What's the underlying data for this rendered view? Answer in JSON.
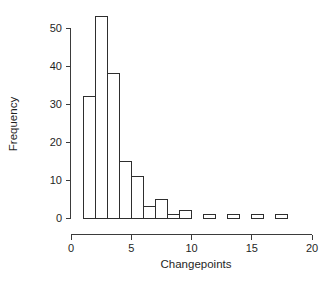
{
  "chart_data": {
    "type": "bar",
    "subtype": "histogram",
    "title": "",
    "xlabel": "Changepoints",
    "ylabel": "Frequency",
    "xlim": [
      0,
      20
    ],
    "ylim": [
      0,
      53
    ],
    "xticks": [
      0,
      5,
      10,
      15,
      20
    ],
    "xticklabels": [
      "0",
      "5",
      "10",
      "15",
      "20"
    ],
    "yticks": [
      0,
      10,
      20,
      30,
      40,
      50
    ],
    "yticklabels": [
      "0",
      "10",
      "20",
      "30",
      "40",
      "50"
    ],
    "grid": false,
    "legend": null,
    "bin_width": 1,
    "bin_edges": [
      1,
      2,
      3,
      4,
      5,
      6,
      7,
      8,
      9,
      10,
      11,
      12,
      13,
      14,
      15,
      16,
      17,
      18
    ],
    "bins": [
      {
        "x0": 1,
        "x1": 2,
        "value": 32
      },
      {
        "x0": 2,
        "x1": 3,
        "value": 53
      },
      {
        "x0": 3,
        "x1": 4,
        "value": 38
      },
      {
        "x0": 4,
        "x1": 5,
        "value": 15
      },
      {
        "x0": 5,
        "x1": 6,
        "value": 11
      },
      {
        "x0": 6,
        "x1": 7,
        "value": 3
      },
      {
        "x0": 7,
        "x1": 8,
        "value": 5
      },
      {
        "x0": 8,
        "x1": 9,
        "value": 1
      },
      {
        "x0": 9,
        "x1": 10,
        "value": 2
      },
      {
        "x0": 10,
        "x1": 11,
        "value": 0
      },
      {
        "x0": 11,
        "x1": 12,
        "value": 1
      },
      {
        "x0": 12,
        "x1": 13,
        "value": 0
      },
      {
        "x0": 13,
        "x1": 14,
        "value": 1
      },
      {
        "x0": 14,
        "x1": 15,
        "value": 0
      },
      {
        "x0": 15,
        "x1": 16,
        "value": 1
      },
      {
        "x0": 16,
        "x1": 17,
        "value": 0
      },
      {
        "x0": 17,
        "x1": 18,
        "value": 1
      }
    ],
    "categories": [
      "1-2",
      "2-3",
      "3-4",
      "4-5",
      "5-6",
      "6-7",
      "7-8",
      "8-9",
      "9-10",
      "10-11",
      "11-12",
      "12-13",
      "13-14",
      "14-15",
      "15-16",
      "16-17",
      "17-18"
    ],
    "values": [
      32,
      53,
      38,
      15,
      11,
      3,
      5,
      1,
      2,
      0,
      1,
      0,
      1,
      0,
      1,
      0,
      1
    ],
    "colors": {
      "bar_fill": "#ffffff",
      "bar_stroke": "#2e2e2e",
      "axis": "#3b3b3b",
      "text": "#1f1f1f",
      "background": "#ffffff"
    }
  }
}
